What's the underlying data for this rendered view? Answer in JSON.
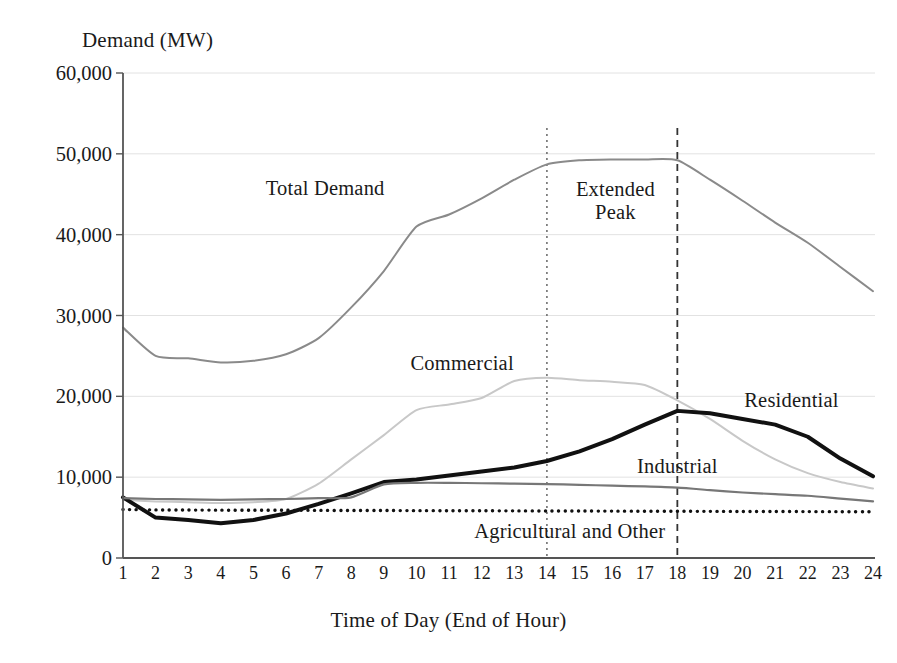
{
  "chart_data": {
    "type": "line",
    "title": "",
    "xlabel": "Time of Day (End of Hour)",
    "ylabel": "Demand (MW)",
    "xlim": [
      1,
      24
    ],
    "ylim": [
      0,
      60000
    ],
    "yticks": [
      "0",
      "10,000",
      "20,000",
      "30,000",
      "40,000",
      "50,000",
      "60,000"
    ],
    "ytick_values": [
      0,
      10000,
      20000,
      30000,
      40000,
      50000,
      60000
    ],
    "grid": "horizontal-light",
    "legend_position": "inline-annotations",
    "categories": [
      1,
      2,
      3,
      4,
      5,
      6,
      7,
      8,
      9,
      10,
      11,
      12,
      13,
      14,
      15,
      16,
      17,
      18,
      19,
      20,
      21,
      22,
      23,
      24
    ],
    "xtick_labels": [
      "1",
      "2",
      "3",
      "4",
      "5",
      "6",
      "7",
      "8",
      "9",
      "10",
      "11",
      "12",
      "13",
      "14",
      "15",
      "16",
      "17",
      "18",
      "19",
      "20",
      "21",
      "22",
      "23",
      "24"
    ],
    "series": [
      {
        "name": "Total Demand",
        "color": "#8a8a8a",
        "style": "solid",
        "width": 2,
        "values": [
          28500,
          25000,
          24700,
          24200,
          24400,
          25200,
          27200,
          31000,
          35500,
          41000,
          42500,
          44500,
          46800,
          48700,
          49200,
          49300,
          49300,
          49200,
          46800,
          44200,
          41500,
          39000,
          36000,
          33000
        ]
      },
      {
        "name": "Commercial",
        "color": "#c8c8c8",
        "style": "solid",
        "width": 2,
        "values": [
          7200,
          7000,
          6900,
          6800,
          6900,
          7300,
          9200,
          12200,
          15200,
          18300,
          19000,
          19800,
          21900,
          22300,
          22000,
          21800,
          21400,
          19500,
          17200,
          14500,
          12200,
          10500,
          9400,
          8600
        ]
      },
      {
        "name": "Residential",
        "color": "#111111",
        "style": "solid",
        "width": 4,
        "values": [
          7500,
          5000,
          4700,
          4300,
          4700,
          5500,
          6700,
          8000,
          9400,
          9700,
          10200,
          10700,
          11200,
          12000,
          13200,
          14700,
          16500,
          18200,
          17900,
          17200,
          16500,
          15000,
          12300,
          10100
        ]
      },
      {
        "name": "Industrial",
        "color": "#777777",
        "style": "solid",
        "width": 2.2,
        "values": [
          7400,
          7300,
          7250,
          7200,
          7250,
          7300,
          7400,
          7500,
          9100,
          9300,
          9300,
          9250,
          9200,
          9150,
          9050,
          8950,
          8850,
          8700,
          8400,
          8100,
          7900,
          7700,
          7350,
          7000
        ]
      },
      {
        "name": "Agricultural and Other",
        "color": "#111111",
        "style": "dotted",
        "width": 3.4,
        "values": [
          6000,
          5950,
          5930,
          5920,
          5900,
          5900,
          5890,
          5880,
          5870,
          5860,
          5850,
          5840,
          5830,
          5820,
          5810,
          5800,
          5790,
          5780,
          5770,
          5760,
          5750,
          5740,
          5730,
          5720
        ]
      }
    ],
    "annotations": [
      {
        "text": "Total Demand",
        "x_hour": 7.2,
        "y_value": 45800
      },
      {
        "text": "Extended Peak",
        "line1": "Extended",
        "line2": "Peak",
        "x_hour": 16.1,
        "y_value": 44200
      },
      {
        "text": "Commercial",
        "x_hour": 11.4,
        "y_value": 24100
      },
      {
        "text": "Residential",
        "x_hour": 21.5,
        "y_value": 19600
      },
      {
        "text": "Industrial",
        "x_hour": 18.0,
        "y_value": 11400
      },
      {
        "text": "Agricultural and Other",
        "x_hour": 14.7,
        "y_value": 3400
      }
    ],
    "vertical_markers": [
      {
        "label": "peak-start",
        "x_hour": 14,
        "style": "dotted",
        "color": "#666666"
      },
      {
        "label": "peak-end",
        "x_hour": 18,
        "style": "dashed",
        "color": "#333333"
      }
    ]
  },
  "axes": {
    "y_title": "Demand (MW)",
    "x_title": "Time of Day (End of Hour)"
  }
}
